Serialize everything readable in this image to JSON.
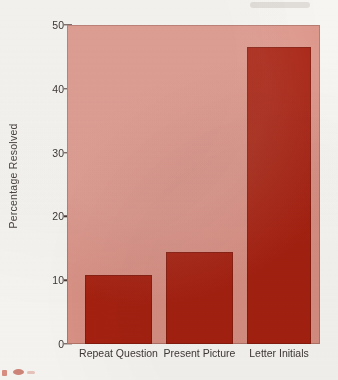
{
  "chart_data": {
    "type": "bar",
    "title": "",
    "subtitle": "",
    "xlabel": "",
    "ylabel": "Percentage Resolved",
    "categories": [
      "Repeat Question",
      "Present Picture",
      "Letter Initials"
    ],
    "values": [
      10.8,
      14.4,
      46.5
    ],
    "series": [
      {
        "name": "Percentage Resolved",
        "values": [
          10.8,
          14.4,
          46.5
        ]
      }
    ],
    "ylim": [
      0,
      50
    ],
    "yticks": [
      0,
      10,
      20,
      30,
      40,
      50
    ],
    "ytick_labels": [
      "0",
      "10",
      "20",
      "30",
      "40",
      "50"
    ],
    "grid": false,
    "legend": false,
    "legend_position": "none",
    "bar_color": "#a8200f",
    "plot_background_color": "#dd9589",
    "page_background_color": "#f7f5f1",
    "axis_text_color": "#3d3836"
  },
  "axes": {
    "y_title": "Percentage Resolved"
  }
}
